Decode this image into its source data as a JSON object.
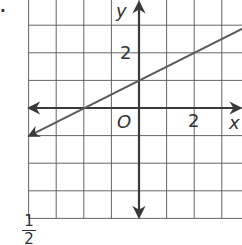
{
  "problem": {
    "number_fragment": "."
  },
  "footer": {
    "fraction_numerator": "1",
    "fraction_denominator": "2"
  },
  "labels": {
    "y_axis": "y",
    "x_axis": "x",
    "origin": "O",
    "y_tick": "2",
    "x_tick": "2"
  },
  "colors": {
    "grid": "#555555",
    "axes": "#3a3a3a",
    "line": "#5a5a5a",
    "text": "#333333"
  },
  "chart_data": {
    "type": "line",
    "title": "",
    "xlabel": "x",
    "ylabel": "y",
    "xlim": [
      -4,
      3.8
    ],
    "ylim": [
      -4,
      4
    ],
    "grid": true,
    "grid_step": 1,
    "tick_labels": {
      "x": [
        {
          "value": 2,
          "label": "2"
        }
      ],
      "y": [
        {
          "value": 2,
          "label": "2"
        }
      ]
    },
    "origin_label": "O",
    "series": [
      {
        "name": "y = 1/2 x + 1",
        "slope": 0.5,
        "intercept": 1,
        "x": [
          -4,
          -2,
          0,
          2,
          3.75
        ],
        "y": [
          -1,
          0,
          1,
          2,
          2.875
        ],
        "arrows": "both"
      }
    ]
  }
}
